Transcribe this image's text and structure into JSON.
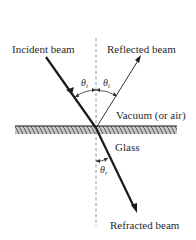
{
  "diagram": {
    "labels": {
      "incident_beam": "Incident beam",
      "reflected_beam": "Reflected beam",
      "medium_top": "Vacuum (or air)",
      "medium_bottom": "Glass",
      "refracted_beam": "Refracted beam"
    },
    "angles": {
      "incident": {
        "symbol": "θ",
        "subscript": "i"
      },
      "reflected": {
        "symbol": "θ",
        "subscript": "i"
      },
      "refracted": {
        "symbol": "θ",
        "subscript": "r"
      }
    },
    "colors": {
      "line": "#1a1a1a",
      "normal": "#888888",
      "hatch_fill": "#bdbdbd",
      "hatch_stroke": "#555555",
      "text": "#2a2a2a"
    }
  }
}
